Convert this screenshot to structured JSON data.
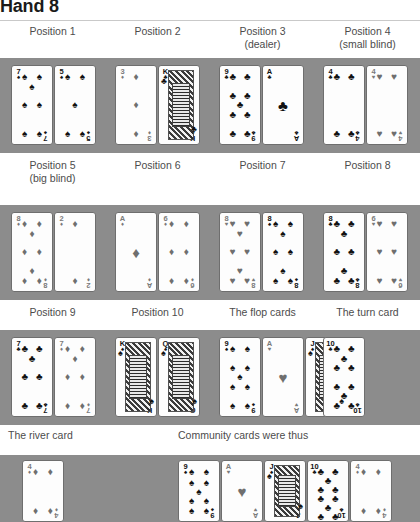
{
  "title": "Hand 8",
  "suit_glyphs": {
    "S": "♠",
    "H": "♥",
    "D": "♦",
    "C": "♣"
  },
  "rows": [
    {
      "labels": [
        {
          "main": "Position 1",
          "sub": ""
        },
        {
          "main": "Position 2",
          "sub": ""
        },
        {
          "main": "Position 3",
          "sub": "(dealer)"
        },
        {
          "main": "Position 4",
          "sub": "(small blind)"
        }
      ],
      "groups": [
        {
          "name": "position-1-hole-cards",
          "cards": [
            "7S",
            "5S"
          ]
        },
        {
          "name": "position-2-hole-cards",
          "cards": [
            "3D",
            "KC"
          ]
        },
        {
          "name": "position-3-hole-cards",
          "cards": [
            "9C",
            "AC"
          ]
        },
        {
          "name": "position-4-hole-cards",
          "cards": [
            "4C",
            "4H"
          ]
        }
      ]
    },
    {
      "labels": [
        {
          "main": "Position 5",
          "sub": "(big blind)"
        },
        {
          "main": "Position 6",
          "sub": ""
        },
        {
          "main": "Position 7",
          "sub": ""
        },
        {
          "main": "Position 8",
          "sub": ""
        }
      ],
      "groups": [
        {
          "name": "position-5-hole-cards",
          "cards": [
            "8D",
            "2D"
          ]
        },
        {
          "name": "position-6-hole-cards",
          "cards": [
            "AD",
            "6D"
          ]
        },
        {
          "name": "position-7-hole-cards",
          "cards": [
            "8H",
            "8S"
          ]
        },
        {
          "name": "position-8-hole-cards",
          "cards": [
            "8C",
            "6H"
          ]
        }
      ]
    },
    {
      "labels": [
        {
          "main": "Position 9",
          "sub": ""
        },
        {
          "main": "Position 10",
          "sub": ""
        },
        {
          "main": "The flop cards",
          "sub": ""
        },
        {
          "main": "The turn card",
          "sub": ""
        }
      ],
      "groups": [
        {
          "name": "position-9-hole-cards",
          "cards": [
            "7C",
            "7D"
          ]
        },
        {
          "name": "position-10-hole-cards",
          "cards": [
            "KS",
            "QS"
          ]
        },
        {
          "name": "flop-cards",
          "cards": [
            "9S",
            "AH",
            "JS"
          ]
        },
        {
          "name": "turn-card",
          "cards": [
            "10C"
          ]
        }
      ]
    }
  ],
  "bottom": {
    "labels": [
      {
        "main": "The river card"
      },
      {
        "main": "Community cards were thus"
      }
    ],
    "groups": [
      {
        "name": "river-card",
        "cards": [
          "4D"
        ]
      },
      {
        "name": "community-cards",
        "cards": [
          "9S",
          "AH",
          "JS",
          "10C",
          "4D"
        ]
      }
    ]
  }
}
